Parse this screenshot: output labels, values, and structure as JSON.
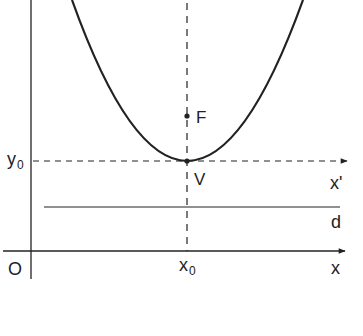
{
  "diagram": {
    "colors": {
      "stroke": "#222222",
      "background": "#ffffff"
    },
    "labels": {
      "origin": "O",
      "x_axis": "x",
      "x_prime_axis": "x'",
      "x0": "x",
      "x0_sub": "0",
      "y0": "y",
      "y0_sub": "0",
      "focus": "F",
      "vertex": "V",
      "directrix": "d"
    }
  }
}
